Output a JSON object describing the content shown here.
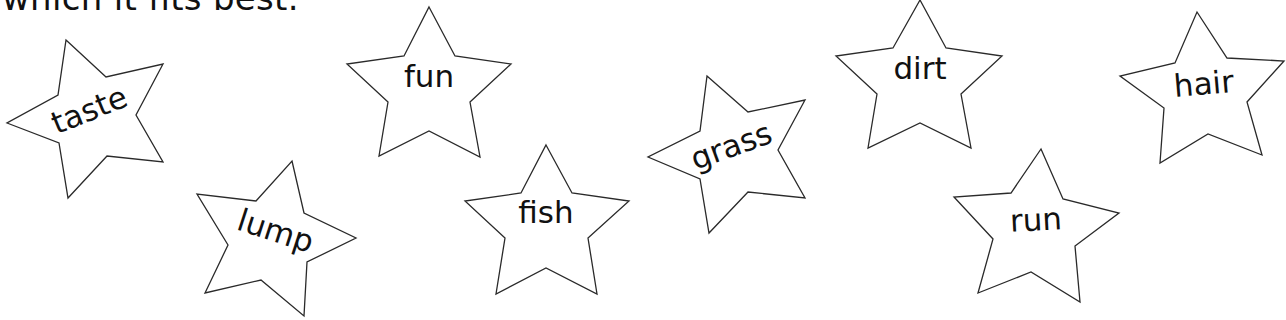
{
  "heading": "which it fits best.",
  "stars": [
    {
      "word": "taste",
      "points": "66,40 106,77 163,64 136,115 163,162 107,156 68,198 59,143 7,123 58,95",
      "tx": 90,
      "ty": 112,
      "rot": -22
    },
    {
      "word": "lump",
      "points": "292,161 304,213 356,238 307,262 304,316 261,280 205,293 228,245 197,194 256,201",
      "tx": 275,
      "ty": 233,
      "rot": 18
    },
    {
      "word": "fun",
      "points": "429,7 455,56 511,64 470,102 480,157 429,131 379,156 388,102 347,64 404,56",
      "tx": 429,
      "ty": 78,
      "rot": 0
    },
    {
      "word": "fish",
      "points": "546,145 572,193 629,201 588,238 597,294 546,268 496,294 505,238 465,201 521,193",
      "tx": 546,
      "ty": 214,
      "rot": 0
    },
    {
      "word": "grass",
      "points": "707,76 748,112 805,100 778,150 805,198 748,192 709,233 700,179 648,157 700,131",
      "tx": 732,
      "ty": 148,
      "rot": -20
    },
    {
      "word": "dirt",
      "points": "920,0 946,48 1002,56 961,94 971,148 920,123 868,148 877,94 836,56 893,48",
      "tx": 920,
      "ty": 70,
      "rot": 0
    },
    {
      "word": "hair",
      "points": "1197,12 1227,58 1284,61 1247,102 1262,155 1208,134 1160,163 1164,108 1120,76 1175,63",
      "tx": 1204,
      "ty": 86,
      "rot": -5
    },
    {
      "word": "run",
      "points": "1041,149 1063,199 1119,213 1075,246 1080,302 1031,272 978,293 993,239 954,197 1011,193",
      "tx": 1036,
      "ty": 222,
      "rot": -3
    }
  ]
}
